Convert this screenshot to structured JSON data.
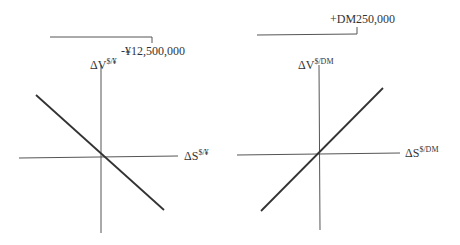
{
  "diagrams": [
    {
      "id": "yen",
      "position_label": "-¥12,500,000",
      "y_axis": {
        "main": "ΔV",
        "sup": "$/¥"
      },
      "x_axis": {
        "main": "ΔS",
        "sup": "$/¥"
      },
      "slope": "negative"
    },
    {
      "id": "dm",
      "position_label": "+DM250,000",
      "y_axis": {
        "main": "ΔV",
        "sup": "$/DM"
      },
      "x_axis": {
        "main": "ΔS",
        "sup": "$/DM"
      },
      "slope": "positive"
    }
  ],
  "colors": {
    "line": "#333333",
    "axis": "#555555"
  }
}
